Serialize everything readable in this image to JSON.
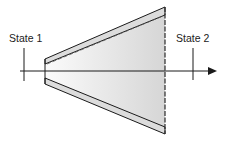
{
  "diagram": {
    "type": "diffuser-cross-section",
    "labels": {
      "state1": "State 1",
      "state2": "State 2"
    },
    "colors": {
      "line": "#1a1a1a",
      "wall_fill": "#d9d9d9",
      "interior_fill_light": "#f7f7f7",
      "interior_fill_dark": "#d4d4d4",
      "background": "#ffffff"
    },
    "geometry": {
      "axis": {
        "x1": 20,
        "x2": 208,
        "y": 71,
        "arrow_tip_x": 217
      },
      "state1_marker": {
        "x": 24,
        "y1": 48,
        "y2": 81,
        "label_x": 8,
        "label_y": 42
      },
      "state2_marker": {
        "x": 193,
        "y1": 48,
        "y2": 80,
        "label_x": 176,
        "label_y": 42
      },
      "inlet": {
        "x": 45,
        "outer_top": 59,
        "inner_top": 64,
        "inner_bottom": 78,
        "outer_bottom": 84
      },
      "outlet": {
        "x": 165,
        "outer_top": 7,
        "inner_top": 15,
        "inner_bottom": 127,
        "outer_bottom": 134
      }
    }
  }
}
